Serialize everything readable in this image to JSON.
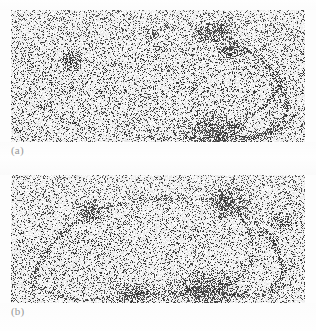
{
  "figure": {
    "type": "two-panel grayscale micrograph figure",
    "background_color": "#fdfdfd",
    "width": 316,
    "height": 331,
    "panels": [
      {
        "id": "a",
        "label": "(a)",
        "rect": {
          "x": 11,
          "y": 10,
          "width": 294,
          "height": 132
        },
        "media": "grainy halftone grayscale scan",
        "base_gray": "#ededed",
        "ink_color": "#2e2e2e",
        "noise": {
          "density": 0.46,
          "dot_size": 1,
          "seed": 1471
        },
        "description": "Noisy speckled field crossed by a long dark curved filament that sweeps from upper-right down to lower-right, with a faint secondary arc across the lower left and several dense dark blobs.",
        "blobs": [
          {
            "name": "left-spot",
            "cx": 62,
            "cy": 50,
            "rx": 7,
            "ry": 6,
            "darkness": 0.86
          },
          {
            "name": "top-small-spot",
            "cx": 143,
            "cy": 24,
            "rx": 4,
            "ry": 3,
            "darkness": 0.7
          },
          {
            "name": "top-cluster-a",
            "cx": 192,
            "cy": 24,
            "rx": 6,
            "ry": 5,
            "darkness": 0.8
          },
          {
            "name": "top-cluster-b",
            "cx": 210,
            "cy": 21,
            "rx": 9,
            "ry": 7,
            "darkness": 0.88
          },
          {
            "name": "upper-node",
            "cx": 219,
            "cy": 41,
            "rx": 8,
            "ry": 7,
            "darkness": 0.88
          },
          {
            "name": "junction-blob",
            "cx": 204,
            "cy": 124,
            "rx": 19,
            "ry": 12,
            "darkness": 0.92
          },
          {
            "name": "right-edge-node",
            "cx": 270,
            "cy": 77,
            "rx": 5,
            "ry": 4,
            "darkness": 0.72
          }
        ],
        "arcs": [
          {
            "name": "main-right-arc",
            "points": [
              [
                213,
                28
              ],
              [
                248,
                48
              ],
              [
                268,
                74
              ],
              [
                276,
                100
              ],
              [
                262,
                120
              ],
              [
                232,
                130
              ]
            ],
            "width": 2.3,
            "darkness": 0.8
          },
          {
            "name": "inner-return-arc",
            "points": [
              [
                268,
                78
              ],
              [
                250,
                98
              ],
              [
                226,
                114
              ],
              [
                208,
                123
              ]
            ],
            "width": 2.0,
            "darkness": 0.72
          },
          {
            "name": "lower-sweep-arc",
            "points": [
              [
                210,
                126
              ],
              [
                248,
                126
              ],
              [
                272,
                117
              ],
              [
                286,
                100
              ]
            ],
            "width": 1.8,
            "darkness": 0.62
          },
          {
            "name": "faint-left-arc",
            "points": [
              [
                28,
                96
              ],
              [
                70,
                116
              ],
              [
                120,
                126
              ],
              [
                170,
                128
              ],
              [
                200,
                126
              ]
            ],
            "width": 1.4,
            "darkness": 0.4
          },
          {
            "name": "faint-upper-arc",
            "points": [
              [
                14,
                60
              ],
              [
                40,
                52
              ],
              [
                66,
                50
              ],
              [
                96,
                54
              ],
              [
                130,
                58
              ]
            ],
            "width": 1.0,
            "darkness": 0.26
          }
        ]
      },
      {
        "id": "b",
        "label": "(b)",
        "rect": {
          "x": 11,
          "y": 175,
          "width": 294,
          "height": 128
        },
        "media": "grainy halftone grayscale scan",
        "base_gray": "#efefef",
        "ink_color": "#2e2e2e",
        "noise": {
          "density": 0.44,
          "dot_size": 1,
          "seed": 9083
        },
        "description": "Noisy speckled field containing a large closed loop; a dark band runs from the upper-right corner down toward a dense blob at bottom-centre-right, with a long arc closing around the left and bottom.",
        "blobs": [
          {
            "name": "upper-left-spot",
            "cx": 78,
            "cy": 38,
            "rx": 8,
            "ry": 7,
            "darkness": 0.88
          },
          {
            "name": "top-faint-spot",
            "cx": 152,
            "cy": 23,
            "rx": 5,
            "ry": 3,
            "darkness": 0.55
          },
          {
            "name": "upper-right-node",
            "cx": 216,
            "cy": 27,
            "rx": 13,
            "ry": 10,
            "darkness": 0.9
          },
          {
            "name": "right-edge-flare",
            "cx": 268,
            "cy": 46,
            "rx": 7,
            "ry": 6,
            "darkness": 0.72
          },
          {
            "name": "bottom-blob",
            "cx": 195,
            "cy": 116,
            "rx": 21,
            "ry": 11,
            "darkness": 0.93
          },
          {
            "name": "bottom-left-blob",
            "cx": 122,
            "cy": 119,
            "rx": 14,
            "ry": 7,
            "darkness": 0.82
          }
        ],
        "arcs": [
          {
            "name": "upper-left-limb",
            "points": [
              [
                74,
                40
              ],
              [
                54,
                56
              ],
              [
                36,
                76
              ],
              [
                24,
                98
              ],
              [
                22,
                116
              ]
            ],
            "width": 2.2,
            "darkness": 0.74
          },
          {
            "name": "upper-right-limb",
            "points": [
              [
                86,
                34
              ],
              [
                130,
                26
              ],
              [
                176,
                24
              ],
              [
                212,
                26
              ]
            ],
            "width": 1.8,
            "darkness": 0.55
          },
          {
            "name": "right-descent",
            "points": [
              [
                222,
                32
              ],
              [
                248,
                50
              ],
              [
                266,
                74
              ],
              [
                272,
                98
              ],
              [
                258,
                114
              ]
            ],
            "width": 2.4,
            "darkness": 0.84
          },
          {
            "name": "inner-chord",
            "points": [
              [
                226,
                36
              ],
              [
                240,
                62
              ],
              [
                240,
                88
              ],
              [
                224,
                106
              ],
              [
                204,
                114
              ]
            ],
            "width": 2.0,
            "darkness": 0.7
          },
          {
            "name": "bottom-arc",
            "points": [
              [
                24,
                112
              ],
              [
                62,
                124
              ],
              [
                112,
                122
              ],
              [
                166,
                118
              ],
              [
                206,
                114
              ]
            ],
            "width": 2.0,
            "darkness": 0.66
          },
          {
            "name": "outer-bottom-arc",
            "points": [
              [
                208,
                118
              ],
              [
                242,
                122
              ],
              [
                268,
                114
              ],
              [
                284,
                96
              ]
            ],
            "width": 1.8,
            "darkness": 0.62
          }
        ]
      }
    ]
  }
}
